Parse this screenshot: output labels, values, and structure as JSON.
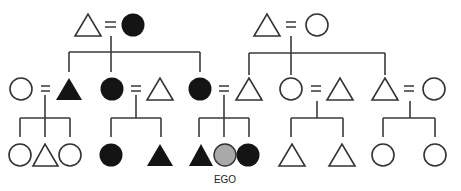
{
  "diagram": {
    "legend": {
      "triangle": "male",
      "circle": "female",
      "equals": "marriage",
      "filled_black": "black",
      "ego_fill": "#aaaaaa",
      "open_fill": "#ffffff"
    },
    "ego_label": "EGO",
    "generations": [
      {
        "level": 1,
        "couples": [
          {
            "id": "g1-left",
            "husband": {
              "shape": "triangle",
              "fill": "open"
            },
            "wife": {
              "shape": "circle",
              "fill": "black"
            }
          },
          {
            "id": "g1-right",
            "husband": {
              "shape": "triangle",
              "fill": "open"
            },
            "wife": {
              "shape": "circle",
              "fill": "open"
            }
          }
        ]
      },
      {
        "level": 2,
        "couples": [
          {
            "id": "g2-a",
            "left": {
              "shape": "circle",
              "fill": "open"
            },
            "right": {
              "shape": "triangle",
              "fill": "black"
            }
          },
          {
            "id": "g2-b",
            "left": {
              "shape": "circle",
              "fill": "black"
            },
            "right": {
              "shape": "triangle",
              "fill": "open"
            }
          },
          {
            "id": "g2-c",
            "left": {
              "shape": "circle",
              "fill": "black"
            },
            "right": {
              "shape": "triangle",
              "fill": "open"
            }
          },
          {
            "id": "g2-d",
            "left": {
              "shape": "circle",
              "fill": "open"
            },
            "right": {
              "shape": "triangle",
              "fill": "open"
            }
          },
          {
            "id": "g2-e",
            "left": {
              "shape": "triangle",
              "fill": "open"
            },
            "right": {
              "shape": "circle",
              "fill": "open"
            }
          }
        ]
      },
      {
        "level": 3,
        "sibling_sets": [
          {
            "parents": "g2-a",
            "children": [
              {
                "shape": "circle",
                "fill": "open"
              },
              {
                "shape": "triangle",
                "fill": "open"
              },
              {
                "shape": "circle",
                "fill": "open"
              }
            ]
          },
          {
            "parents": "g2-b",
            "children": [
              {
                "shape": "circle",
                "fill": "black"
              },
              {
                "shape": "triangle",
                "fill": "black"
              }
            ]
          },
          {
            "parents": "g2-c",
            "children": [
              {
                "shape": "triangle",
                "fill": "black"
              },
              {
                "shape": "circle",
                "fill": "gray",
                "ego": true
              },
              {
                "shape": "circle",
                "fill": "black"
              }
            ]
          },
          {
            "parents": "g2-d",
            "children": [
              {
                "shape": "triangle",
                "fill": "open"
              },
              {
                "shape": "triangle",
                "fill": "open"
              }
            ]
          },
          {
            "parents": "g2-e",
            "children": [
              {
                "shape": "circle",
                "fill": "open"
              },
              {
                "shape": "circle",
                "fill": "open"
              }
            ]
          }
        ]
      }
    ]
  }
}
